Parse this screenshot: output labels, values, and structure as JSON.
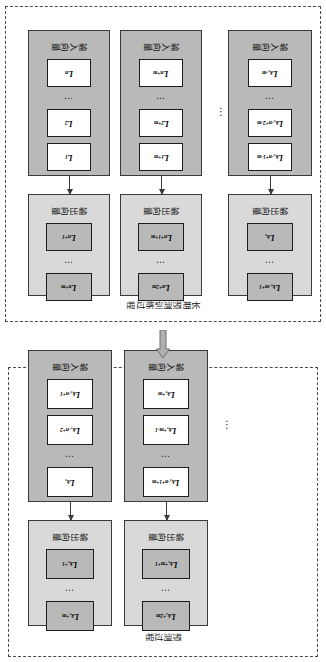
{
  "figure": {
    "prediction": {
      "title": "预测过程",
      "rows": [
        {
          "input": {
            "label": "输入向量",
            "cells": [
              "L",
              "L",
              "L"
            ],
            "subs": [
              "k₀-n+1",
              "k₀-n+2",
              "k₀"
            ],
            "ellipsis": "⋯",
            "ellipsis_after": 2
          },
          "output": {
            "label": "输出向量",
            "cells": [
              "L",
              "L"
            ],
            "subs": [
              "k₀+1",
              "k₀+m"
            ],
            "ellipsis": "⋯",
            "ellipsis_after": 1
          }
        },
        {
          "input": {
            "label": "输入向量",
            "cells": [
              "L",
              "L",
              "L"
            ],
            "subs": [
              "k₀-n+1+m",
              "k₀+m-1",
              "k₀+m"
            ],
            "ellipsis": "⋯",
            "ellipsis_after": 1
          },
          "output": {
            "label": "输出向量",
            "cells": [
              "L",
              "L"
            ],
            "subs": [
              "k₀+m+1",
              "k₀+2m"
            ],
            "ellipsis": "⋯",
            "ellipsis_after": 1
          }
        }
      ],
      "column_ellipsis": "⋮"
    },
    "training": {
      "title": "长期预测训练过程",
      "rows": [
        {
          "input": {
            "label": "输入向量",
            "cells": [
              "L",
              "L",
              "L"
            ],
            "subs": [
              "1",
              "2",
              "n"
            ],
            "ellipsis": "⋯",
            "ellipsis_after": 2
          },
          "output": {
            "label": "输出向量",
            "cells": [
              "L",
              "L"
            ],
            "subs": [
              "n+1",
              "n+m"
            ],
            "ellipsis": "⋯",
            "ellipsis_after": 1
          }
        },
        {
          "input": {
            "label": "输入向量",
            "cells": [
              "L",
              "L",
              "L"
            ],
            "subs": [
              "1+m",
              "2+m",
              "n+m"
            ],
            "ellipsis": "⋯",
            "ellipsis_after": 2
          },
          "output": {
            "label": "输出向量",
            "cells": [
              "L",
              "L"
            ],
            "subs": [
              "n+1+m",
              "n+2m"
            ],
            "ellipsis": "⋯",
            "ellipsis_after": 1
          }
        },
        {
          "input": {
            "label": "输入向量",
            "cells": [
              "L",
              "L",
              "L"
            ],
            "subs": [
              "k₀-n+1-m",
              "k₀-n+2-m",
              "k₀-m"
            ],
            "ellipsis": "⋯",
            "ellipsis_after": 2
          },
          "output": {
            "label": "输出向量",
            "cells": [
              "L",
              "L"
            ],
            "subs": [
              "k₀-m+1",
              "k₀"
            ],
            "ellipsis": "⋯",
            "ellipsis_after": 1
          }
        }
      ],
      "column_ellipsis": "⋮"
    },
    "flow_arrow": "up-arrow-icon",
    "colors": {
      "input_fill": "#b9b9b9",
      "output_fill": "#d9d9d9",
      "cell_input_fill": "#ffffff",
      "cell_output_fill": "#b9b9b9",
      "border": "#3a3a3a",
      "dashed_border": "#4a4a4a",
      "arrow_fill": "#b0b0b0"
    }
  }
}
